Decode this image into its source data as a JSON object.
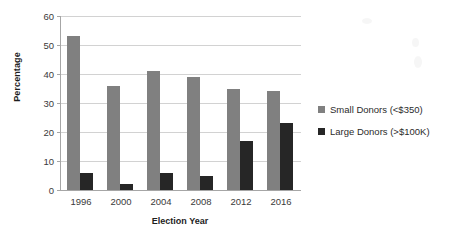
{
  "chart_data": {
    "type": "bar",
    "title": "",
    "xlabel": "Election Year",
    "ylabel": "Percentage",
    "categories": [
      "1996",
      "2000",
      "2004",
      "2008",
      "2012",
      "2016"
    ],
    "series": [
      {
        "name": "Small Donors (<$350)",
        "color": "#808080",
        "values": [
          53,
          36,
          41,
          39,
          35,
          34
        ]
      },
      {
        "name": "Large Donors (>$100K)",
        "color": "#262626",
        "values": [
          6,
          2,
          6,
          5,
          17,
          23
        ]
      }
    ],
    "ylim": [
      0,
      60
    ],
    "yticks": [
      0,
      10,
      20,
      30,
      40,
      50,
      60
    ],
    "ytick_labels": [
      "0",
      "10",
      "20",
      "30",
      "40",
      "50",
      "60"
    ],
    "grid": true,
    "legend_position": "right",
    "background_color": "#ffffff",
    "axis_color": "#a6a6a6",
    "gridline_color": "#d2d2d2"
  }
}
